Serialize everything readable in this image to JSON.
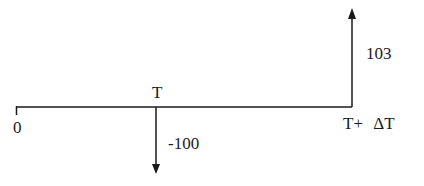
{
  "diagram": {
    "type": "cash-flow timeline",
    "timeline_labels": {
      "start": "0",
      "mid": "T",
      "end": "T+ ΔT"
    },
    "cash_flows": [
      {
        "time": "T",
        "amount": "-100",
        "direction": "down"
      },
      {
        "time": "T+ ΔT",
        "amount": "103",
        "direction": "up"
      }
    ],
    "line_color": "#1a1a1a"
  }
}
